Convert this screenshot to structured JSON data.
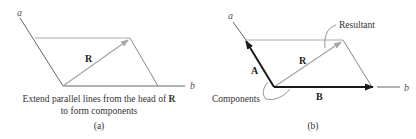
{
  "figure": {
    "panel_a": {
      "axis_a_label": "a",
      "axis_b_label": "b",
      "vector_label": "R",
      "caption_line1_prefix": "Extend parallel lines from the head of ",
      "caption_line1_bold": "R",
      "caption_line2": "to form components",
      "panel_label": "(a)"
    },
    "panel_b": {
      "axis_a_label": "a",
      "axis_b_label": "b",
      "vector_R_label": "R",
      "vector_A_label": "A",
      "vector_B_label": "B",
      "callout_resultant": "Resultant",
      "callout_components": "Components",
      "panel_label": "(b)"
    },
    "colors": {
      "axis_line": "#666666",
      "parallel_line": "#aaaaaa",
      "resultant": "#a6a6a6",
      "component": "#1a1a1a",
      "leader": "#888888"
    }
  }
}
